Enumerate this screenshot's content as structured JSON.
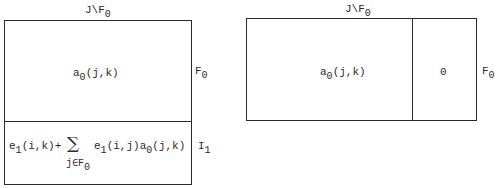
{
  "left_diagram": {
    "top_label": {
      "base": "J\\F",
      "sub": "0"
    },
    "upper_block": {
      "base": "a",
      "sub": "0",
      "rest": "(j,k)"
    },
    "upper_side_label": {
      "base": "F",
      "sub": "0"
    },
    "lower_block": {
      "term1": {
        "base": "e",
        "sub": "1",
        "rest": "(i,k)+"
      },
      "sum_symbol": "∑",
      "sum_index": {
        "base": "j∈F",
        "sub": "0"
      },
      "term2": {
        "base": "e",
        "sub": "1",
        "rest": "(i,j)a"
      },
      "term3": {
        "sub": "0",
        "rest": "(j,k)"
      }
    },
    "lower_side_label": {
      "base": "I",
      "sub": "1"
    }
  },
  "right_diagram": {
    "top_label": {
      "base": "J\\F",
      "sub": "0"
    },
    "left_block": {
      "base": "a",
      "sub": "0",
      "rest": "(j,k)"
    },
    "right_block": "0",
    "side_label": {
      "base": "F",
      "sub": "0"
    }
  }
}
